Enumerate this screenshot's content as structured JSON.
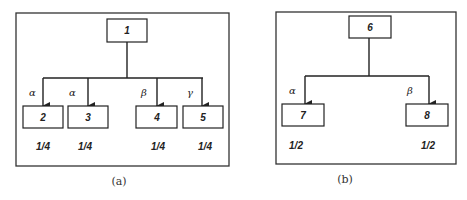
{
  "panels": [
    {
      "caption": "(a)",
      "root": {
        "label": "1"
      },
      "children": [
        {
          "label": "2",
          "edge_label": "α",
          "weight": "1/4"
        },
        {
          "label": "3",
          "edge_label": "α",
          "weight": "1/4"
        },
        {
          "label": "4",
          "edge_label": "β",
          "weight": "1/4"
        },
        {
          "label": "5",
          "edge_label": "γ",
          "weight": "1/4"
        }
      ]
    },
    {
      "caption": "(b)",
      "root": {
        "label": "6"
      },
      "children": [
        {
          "label": "7",
          "edge_label": "α",
          "weight": "1/2"
        },
        {
          "label": "8",
          "edge_label": "β",
          "weight": "1/2"
        }
      ]
    }
  ]
}
